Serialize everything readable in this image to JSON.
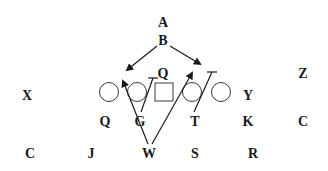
{
  "diagram": {
    "type": "football-play-diagram",
    "colors": {
      "ink": "#1a1a1a",
      "outline": "#3a3a3a",
      "background": "#ffffff"
    },
    "labels": {
      "top_a": "A",
      "top_b": "B",
      "center_q": "Q",
      "left_x": "X",
      "right_y": "Y",
      "far_right_z": "Z",
      "row2_q": "Q",
      "row2_g": "G",
      "row2_t": "T",
      "row2_k": "K",
      "row2_c": "C",
      "row3_c": "C",
      "row3_j": "J",
      "row3_w": "W",
      "row3_s": "S",
      "row3_r": "R"
    },
    "line_of_scrimmage": [
      {
        "shape": "circle",
        "role": "left-tackle"
      },
      {
        "shape": "circle",
        "role": "left-guard"
      },
      {
        "shape": "square",
        "role": "center"
      },
      {
        "shape": "circle",
        "role": "right-guard"
      },
      {
        "shape": "circle",
        "role": "right-tackle"
      }
    ],
    "routes": [
      {
        "from": "B",
        "direction": "down-left",
        "end": "arrow"
      },
      {
        "from": "B",
        "direction": "down-right",
        "end": "arrow"
      },
      {
        "from": "W",
        "direction": "up-left",
        "end": "arrow"
      },
      {
        "from": "W",
        "direction": "up-right",
        "end": "arrow"
      },
      {
        "from": "G",
        "direction": "up-right",
        "end": "block"
      },
      {
        "from": "T",
        "direction": "up-right",
        "end": "block"
      }
    ]
  }
}
